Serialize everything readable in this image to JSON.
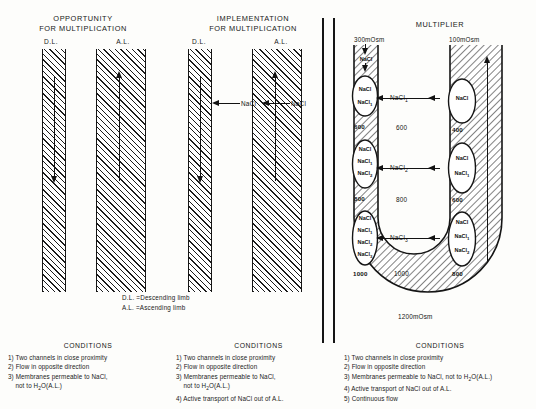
{
  "panels": [
    {
      "id": "opportunity",
      "title": "OPPORTUNITY\nFOR MULTIPLICATION"
    },
    {
      "id": "implementation",
      "title": "IMPLEMENTATION\nFOR MULTIPLICATION"
    },
    {
      "id": "multiplier",
      "title": "MULTIPLIER"
    }
  ],
  "limb_labels": {
    "descending": "D.L.",
    "ascending": "A.L."
  },
  "implementation_flux": [
    {
      "label": "NaCl"
    },
    {
      "label": "NaCl"
    }
  ],
  "legend": [
    "D.L. =Descending limb",
    "A.L. =Ascending limb"
  ],
  "multiplier": {
    "inlet_osm": "300mOsm",
    "outlet_osm": "100mOsm",
    "bend_osm": "1200mOsm",
    "inlet_species": "NaCl",
    "descending_cells": [
      {
        "species": [
          "NaCl",
          "NaCl"
        ],
        "osm": "600"
      },
      {
        "species": [
          "NaCl",
          "NaCl",
          "NaCl"
        ],
        "osm": "800"
      },
      {
        "species": [
          "NaCl",
          "NaCl",
          "NaCl",
          "NaCl"
        ],
        "osm": "1000"
      }
    ],
    "descending_cell_subs": [
      [
        "",
        "1"
      ],
      [
        "",
        "1",
        "2"
      ],
      [
        "",
        "1",
        "2",
        "3"
      ]
    ],
    "ascending_cells": [
      {
        "species": [
          "NaCl"
        ],
        "osm": "400"
      },
      {
        "species": [
          "NaCl",
          "NaCl"
        ],
        "osm": "600"
      },
      {
        "species": [
          "NaCl",
          "NaCl",
          "NaCl"
        ],
        "osm": "800"
      }
    ],
    "ascending_cell_subs": [
      [
        ""
      ],
      [
        "",
        "1"
      ],
      [
        "",
        "1",
        "2"
      ]
    ],
    "interstitium_osm": [
      "600",
      "800",
      "1000"
    ],
    "transport_arrows": [
      {
        "label": "NaCl",
        "sub": "1"
      },
      {
        "label": "NaCl",
        "sub": "2"
      },
      {
        "label": "NaCl",
        "sub": "3"
      }
    ]
  },
  "conditions": [
    {
      "title": "CONDITIONS",
      "items": [
        "1) Two channels in close proximity",
        "2) Flow in opposite direction",
        "3) Membranes permeable to NaCl,\n     not to H2O(A.L.)"
      ]
    },
    {
      "title": "CONDITIONS",
      "items": [
        "1) Two channels in close proximity",
        "2) Flow in opposite direction",
        "3) Membranes permeable to NaCl,\n     not to H2O(A.L.)",
        "4) Active transport of NaCl out of A.L."
      ]
    },
    {
      "title": "CONDITIONS",
      "items": [
        "1) Two channels in close proximity",
        "2) Flow in opposite direction",
        "3) Membranes permeable to NaCl, not to H2O(A.L.)",
        "4) Active transport of NaCl out of A.L.",
        "5) Continuous flow"
      ]
    }
  ],
  "colors": {
    "ink": "#121212",
    "paper": "#fdfdfb"
  }
}
